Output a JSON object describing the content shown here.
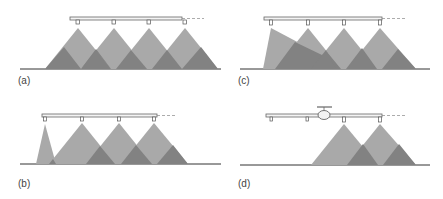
{
  "figure": {
    "colors": {
      "spray_light": "#a6a6a6",
      "spray_dark": "#7d7d7d",
      "boom": "#555555",
      "ground": "#333333"
    },
    "panels": [
      {
        "id": "a",
        "label": "(a)",
        "caption": "Uniform overlap from all nozzles"
      },
      {
        "id": "b",
        "label": "(b)",
        "caption": "First nozzle with narrow spray"
      },
      {
        "id": "c",
        "label": "(c)",
        "caption": "First nozzle spray deflected"
      },
      {
        "id": "d",
        "label": "(d)",
        "caption": "Boom with central aircraft/fuselage, only outer nozzles spraying"
      }
    ]
  }
}
